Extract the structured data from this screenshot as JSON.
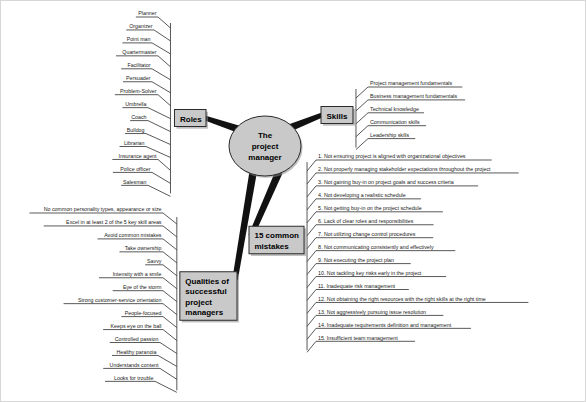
{
  "diagram": {
    "center": {
      "label": "The\nproject\nmanager",
      "lines": [
        "The",
        "project",
        "manager"
      ]
    },
    "colors": {
      "node_fill": "#c9c9c9",
      "node_stroke": "#2b2b2b",
      "line": "#3b3b3b",
      "text": "#1a1a1a",
      "background": "#ffffff"
    },
    "branches": [
      {
        "id": "roles",
        "label": "Roles",
        "items": [
          "Planner",
          "Organizer",
          "Point man",
          "Quartermaster",
          "Facilitator",
          "Persuader",
          "Problem-Solver",
          "Umbrella",
          "Coach",
          "Bulldog",
          "Librarian",
          "Insurance agent",
          "Police officer",
          "Salesman"
        ]
      },
      {
        "id": "skills",
        "label": "Skills",
        "items": [
          "Project management fundamentals",
          "Business management fundamentals",
          "Technical knowledge",
          "Communication skills",
          "Leadership skills"
        ]
      },
      {
        "id": "mistakes",
        "label": "15 common\nmistakes",
        "label_lines": [
          "15 common",
          "mistakes"
        ],
        "items": [
          "1.  Not ensuring project is aligned with organizational objectives",
          "2.  Not properly managing stakeholder expectations throughout the project",
          "3.  Not gaining buy-in on project goals and success criteria",
          "4.  Not developing a realistic schedule",
          "5.  Not getting buy-in on the project schedule",
          "6.  Lack of clear roles and responsibilities",
          "7.  Not utilizing change control procedures",
          "8.  Not communicating consistently and effectively",
          "9.  Not executing the project plan",
          "10.  Not tackling key risks early in the project",
          "11.  Inadequate risk management",
          "12.  Not obtaining the right resources with the right skills at the right time",
          "13.  Not aggressively pursuing issue resolution",
          "14.  Inadequate requirements definition and management",
          "15.  Insufficient team management"
        ]
      },
      {
        "id": "qualities",
        "label": "Qualities of successful project managers",
        "label_lines": [
          "Qualities of",
          "successful",
          "project",
          "managers"
        ],
        "items": [
          "No common personality types, appearance or size",
          "Excel in at least 2 of the 5 key skill areas",
          "Avoid common mistakes",
          "Take ownership",
          "Savvy",
          "Intensity with a smile",
          "Eye of the storm",
          "Strong customer-service orientation",
          "People-focused",
          "Keeps eye on the ball",
          "Controlled passion",
          "Healthy paranoia",
          "Understands content",
          "Looks for trouble"
        ]
      }
    ]
  }
}
